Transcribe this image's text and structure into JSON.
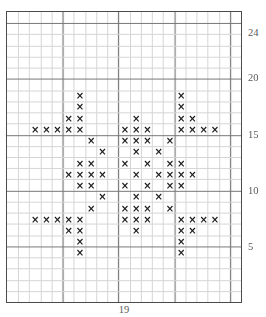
{
  "top_artifact_text": "",
  "chart_data": {
    "type": "heatmap",
    "title": "",
    "subtitle": "",
    "xlabel": "19",
    "ylabel": "",
    "xlim": [
      0,
      21
    ],
    "ylim": [
      0,
      26
    ],
    "grid": true,
    "legend": null,
    "columns": 21,
    "rows": 26,
    "major_every": 5,
    "symbol": "×",
    "symbol_name": "cross-stitch-x",
    "colors": {
      "symbol": "#1a1a1a",
      "border": "#4b4b4b",
      "major_grid": "#777777",
      "minor_grid": "#d5d5d5",
      "label": "#5a5a5a",
      "background": "#ffffff"
    },
    "x_tick_labels": [
      "19"
    ],
    "y_tick_labels": [
      "24",
      "20",
      "15",
      "10",
      "5"
    ],
    "y_ticks": [
      24,
      20,
      15,
      10,
      5
    ],
    "marked_cells_by_row": {
      "19": [
        6,
        15
      ],
      "18": [
        6,
        15
      ],
      "17": [
        5,
        6,
        11,
        15,
        16
      ],
      "16": [
        2,
        3,
        4,
        5,
        6,
        10,
        11,
        12,
        15,
        16,
        17,
        18
      ],
      "15": [
        7,
        10,
        11,
        12,
        14
      ],
      "14": [
        8,
        11,
        13
      ],
      "13": [
        6,
        7,
        10,
        12,
        14,
        15
      ],
      "12": [
        5,
        6,
        7,
        8,
        11,
        13,
        14,
        15,
        16
      ],
      "11": [
        6,
        7,
        10,
        12,
        14,
        15
      ],
      "10": [
        8,
        11,
        13
      ],
      "9": [
        7,
        10,
        11,
        12,
        14
      ],
      "8": [
        2,
        3,
        4,
        5,
        6,
        10,
        11,
        12,
        15,
        16,
        17,
        18
      ],
      "7": [
        5,
        6,
        11,
        15,
        16
      ],
      "6": [
        6,
        15
      ],
      "5": [
        6,
        15
      ]
    },
    "total_marked_cells": 92
  }
}
